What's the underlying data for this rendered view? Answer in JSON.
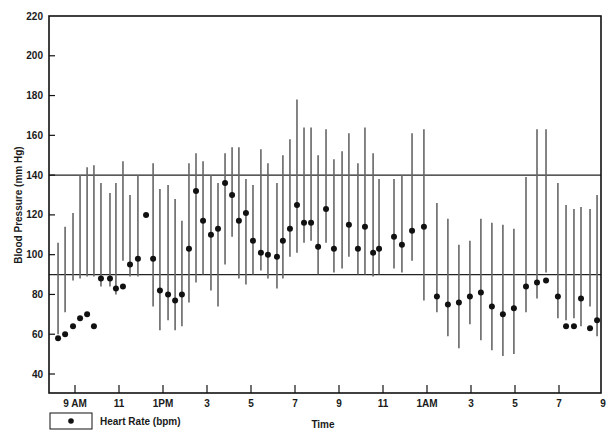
{
  "chart_data": {
    "type": "scatter",
    "title": "",
    "xlabel": "Time",
    "ylabel": "Blood Pressure (mm Hg)",
    "ylim": [
      30,
      220
    ],
    "yticks": [
      40,
      60,
      80,
      100,
      120,
      140,
      160,
      180,
      200,
      220
    ],
    "xlim_hours": [
      7.9,
      33.0
    ],
    "xticks": [
      {
        "hour": 9,
        "label": "9 AM"
      },
      {
        "hour": 11,
        "label": "11"
      },
      {
        "hour": 13,
        "label": "1PM"
      },
      {
        "hour": 15,
        "label": "3"
      },
      {
        "hour": 17,
        "label": "5"
      },
      {
        "hour": 19,
        "label": "7"
      },
      {
        "hour": 21,
        "label": "9"
      },
      {
        "hour": 23,
        "label": "11"
      },
      {
        "hour": 25,
        "label": "1AM"
      },
      {
        "hour": 27,
        "label": "3"
      },
      {
        "hour": 29,
        "label": "5"
      },
      {
        "hour": 31,
        "label": "7"
      },
      {
        "hour": 33,
        "label": "9"
      }
    ],
    "reference_lines": [
      {
        "y": 140,
        "label": "systolic threshold"
      },
      {
        "y": 90,
        "label": "diastolic threshold"
      }
    ],
    "grid": false,
    "legend": {
      "position": "bottom-left",
      "entries": [
        {
          "marker": "dot",
          "label": "Heart Rate (bpm)"
        }
      ]
    },
    "series": [
      {
        "name": "Blood Pressure range (systolic–diastolic)",
        "kind": "vertical-line"
      },
      {
        "name": "Heart Rate (bpm)",
        "kind": "dot"
      }
    ],
    "readings": [
      {
        "hour": 8.23,
        "sbp": 106,
        "dbp": 60,
        "hr": 58
      },
      {
        "hour": 8.55,
        "sbp": 114,
        "dbp": 71,
        "hr": 60
      },
      {
        "hour": 8.91,
        "sbp": 121,
        "dbp": 87,
        "hr": 64
      },
      {
        "hour": 9.23,
        "sbp": 140,
        "dbp": 88,
        "hr": 68
      },
      {
        "hour": 9.55,
        "sbp": 144,
        "dbp": 89,
        "hr": 70
      },
      {
        "hour": 9.86,
        "sbp": 145,
        "dbp": 89,
        "hr": 64
      },
      {
        "hour": 10.18,
        "sbp": 136,
        "dbp": 84,
        "hr": 88
      },
      {
        "hour": 10.59,
        "sbp": 131,
        "dbp": 84,
        "hr": 88
      },
      {
        "hour": 10.86,
        "sbp": 136,
        "dbp": 80,
        "hr": 83
      },
      {
        "hour": 11.18,
        "sbp": 147,
        "dbp": 97,
        "hr": 84
      },
      {
        "hour": 11.5,
        "sbp": 130,
        "dbp": 89,
        "hr": 95
      },
      {
        "hour": 11.86,
        "sbp": 140,
        "dbp": 89,
        "hr": 98
      },
      {
        "hour": 12.23,
        "sbp": null,
        "dbp": null,
        "hr": 120
      },
      {
        "hour": 12.55,
        "sbp": 146,
        "dbp": 74,
        "hr": 98
      },
      {
        "hour": 12.86,
        "sbp": 133,
        "dbp": 62,
        "hr": 82
      },
      {
        "hour": 13.23,
        "sbp": 135,
        "dbp": 67,
        "hr": 80
      },
      {
        "hour": 13.55,
        "sbp": 128,
        "dbp": 62,
        "hr": 77
      },
      {
        "hour": 13.86,
        "sbp": 117,
        "dbp": 64,
        "hr": 80
      },
      {
        "hour": 14.18,
        "sbp": 146,
        "dbp": 76,
        "hr": 103
      },
      {
        "hour": 14.5,
        "sbp": 151,
        "dbp": 86,
        "hr": 132
      },
      {
        "hour": 14.82,
        "sbp": 147,
        "dbp": 90,
        "hr": 117
      },
      {
        "hour": 15.18,
        "sbp": 140,
        "dbp": 82,
        "hr": 110
      },
      {
        "hour": 15.5,
        "sbp": 136,
        "dbp": 74,
        "hr": 113
      },
      {
        "hour": 15.82,
        "sbp": 151,
        "dbp": 95,
        "hr": 136
      },
      {
        "hour": 16.14,
        "sbp": 154,
        "dbp": 109,
        "hr": 130
      },
      {
        "hour": 16.45,
        "sbp": 154,
        "dbp": 88,
        "hr": 117
      },
      {
        "hour": 16.77,
        "sbp": 138,
        "dbp": 85,
        "hr": 121
      },
      {
        "hour": 17.09,
        "sbp": 135,
        "dbp": 90,
        "hr": 107
      },
      {
        "hour": 17.45,
        "sbp": 153,
        "dbp": 92,
        "hr": 101
      },
      {
        "hour": 17.77,
        "sbp": 146,
        "dbp": 88,
        "hr": 100
      },
      {
        "hour": 18.18,
        "sbp": 136,
        "dbp": 83,
        "hr": 99
      },
      {
        "hour": 18.45,
        "sbp": 150,
        "dbp": 88,
        "hr": 107
      },
      {
        "hour": 18.77,
        "sbp": 158,
        "dbp": 99,
        "hr": 113
      },
      {
        "hour": 19.09,
        "sbp": 178,
        "dbp": 101,
        "hr": 125
      },
      {
        "hour": 19.41,
        "sbp": 164,
        "dbp": 106,
        "hr": 116
      },
      {
        "hour": 19.73,
        "sbp": 164,
        "dbp": 107,
        "hr": 116
      },
      {
        "hour": 20.05,
        "sbp": 150,
        "dbp": 90,
        "hr": 104
      },
      {
        "hour": 20.41,
        "sbp": 163,
        "dbp": 106,
        "hr": 123
      },
      {
        "hour": 20.77,
        "sbp": 148,
        "dbp": 91,
        "hr": 103
      },
      {
        "hour": 21.14,
        "sbp": 152,
        "dbp": 93,
        "hr": null
      },
      {
        "hour": 21.45,
        "sbp": 161,
        "dbp": 99,
        "hr": 115
      },
      {
        "hour": 21.86,
        "sbp": 146,
        "dbp": 90,
        "hr": 103
      },
      {
        "hour": 22.18,
        "sbp": 164,
        "dbp": 90,
        "hr": 114
      },
      {
        "hour": 22.55,
        "sbp": 151,
        "dbp": 89,
        "hr": 101
      },
      {
        "hour": 22.82,
        "sbp": 138,
        "dbp": 90,
        "hr": 103
      },
      {
        "hour": 23.5,
        "sbp": 138,
        "dbp": 93,
        "hr": 109
      },
      {
        "hour": 23.86,
        "sbp": 140,
        "dbp": 91,
        "hr": 105
      },
      {
        "hour": 24.32,
        "sbp": 161,
        "dbp": 97,
        "hr": 112
      },
      {
        "hour": 24.86,
        "sbp": 163,
        "dbp": 77,
        "hr": 114
      },
      {
        "hour": 25.45,
        "sbp": 126,
        "dbp": 71,
        "hr": 79
      },
      {
        "hour": 25.95,
        "sbp": 118,
        "dbp": 59,
        "hr": 75
      },
      {
        "hour": 26.45,
        "sbp": 105,
        "dbp": 53,
        "hr": 76
      },
      {
        "hour": 26.95,
        "sbp": 107,
        "dbp": 65,
        "hr": 79
      },
      {
        "hour": 27.45,
        "sbp": 118,
        "dbp": 57,
        "hr": 81
      },
      {
        "hour": 27.95,
        "sbp": 116,
        "dbp": 52,
        "hr": 74
      },
      {
        "hour": 28.45,
        "sbp": 115,
        "dbp": 49,
        "hr": 70
      },
      {
        "hour": 28.95,
        "sbp": 113,
        "dbp": 50,
        "hr": 73
      },
      {
        "hour": 29.5,
        "sbp": 139,
        "dbp": 71,
        "hr": 84
      },
      {
        "hour": 30.0,
        "sbp": 163,
        "dbp": 78,
        "hr": 86
      },
      {
        "hour": 30.41,
        "sbp": 163,
        "dbp": 91,
        "hr": 87
      },
      {
        "hour": 30.95,
        "sbp": 136,
        "dbp": 68,
        "hr": 79
      },
      {
        "hour": 31.32,
        "sbp": 125,
        "dbp": 67,
        "hr": 64
      },
      {
        "hour": 31.68,
        "sbp": 123,
        "dbp": 68,
        "hr": 64
      },
      {
        "hour": 32.0,
        "sbp": 124,
        "dbp": 64,
        "hr": 78
      },
      {
        "hour": 32.41,
        "sbp": 123,
        "dbp": 74,
        "hr": 63
      },
      {
        "hour": 32.73,
        "sbp": 130,
        "dbp": 59,
        "hr": 67
      }
    ]
  },
  "legend": {
    "label": "Heart Rate (bpm)"
  },
  "axes": {
    "xlabel": "Time",
    "ylabel": "Blood Pressure (mm Hg)"
  }
}
